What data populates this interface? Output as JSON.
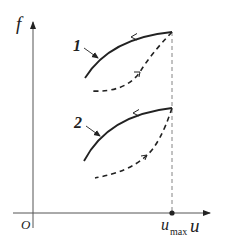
{
  "diagram": {
    "type": "hysteresis-loops",
    "axes": {
      "y_label": "f",
      "x_label": "u",
      "origin_label": "O",
      "x_marker_label": "u",
      "x_marker_subscript": "max"
    },
    "curves": [
      {
        "id": "1",
        "label": "1",
        "loading": "dashed (upward arrow)",
        "unloading": "solid (leftward arrow)"
      },
      {
        "id": "2",
        "label": "2",
        "loading": "dashed (upward arrow)",
        "unloading": "solid (leftward arrow)"
      }
    ],
    "colors": {
      "ink": "#222222",
      "axis": "#555555",
      "background": "#ffffff"
    }
  }
}
